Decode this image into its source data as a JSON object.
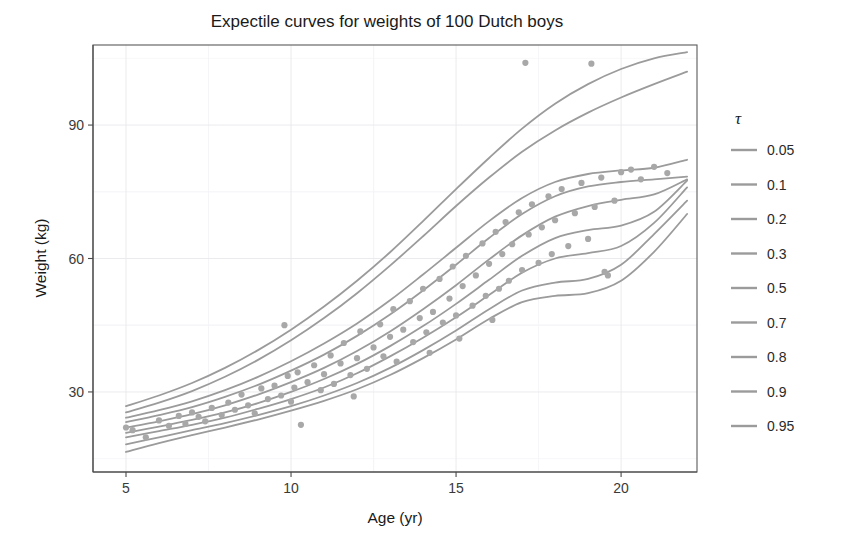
{
  "chart_data": {
    "type": "line",
    "title": "Expectile curves for weights of 100 Dutch boys",
    "xlabel": "Age (yr)",
    "ylabel": "Weight (kg)",
    "xlim": [
      4.0,
      22.3
    ],
    "ylim": [
      12.0,
      108.0
    ],
    "xticks": [
      5,
      10,
      15,
      20
    ],
    "xtick_labels": [
      "5",
      "10",
      "15",
      "20"
    ],
    "yticks": [
      30,
      60,
      90
    ],
    "ytick_labels": [
      "30",
      "60",
      "90"
    ],
    "grid": "minor and major, light gray",
    "legend_position": "right",
    "legend_title": "τ",
    "curve_color": "#9b9b9b",
    "point_color": "#a8a8a8",
    "legend": [
      {
        "label": "0.05",
        "color": "#9b9b9b"
      },
      {
        "label": "0.1",
        "color": "#9b9b9b"
      },
      {
        "label": "0.2",
        "color": "#9b9b9b"
      },
      {
        "label": "0.3",
        "color": "#9b9b9b"
      },
      {
        "label": "0.5",
        "color": "#9b9b9b"
      },
      {
        "label": "0.7",
        "color": "#9b9b9b"
      },
      {
        "label": "0.8",
        "color": "#9b9b9b"
      },
      {
        "label": "0.9",
        "color": "#9b9b9b"
      },
      {
        "label": "0.95",
        "color": "#9b9b9b"
      }
    ],
    "x": [
      5,
      6,
      7,
      8,
      9,
      10,
      11,
      12,
      13,
      14,
      15,
      16,
      17,
      18,
      19,
      20,
      21,
      22
    ],
    "series": [
      {
        "name": "0.05",
        "values": [
          16.5,
          18.5,
          20.3,
          22.0,
          23.8,
          25.8,
          28.0,
          30.6,
          33.8,
          37.6,
          41.8,
          46.4,
          50.2,
          51.6,
          52.2,
          55.0,
          61.5,
          70.0
        ]
      },
      {
        "name": "0.1",
        "values": [
          18.2,
          19.8,
          21.4,
          23.0,
          24.8,
          26.8,
          29.2,
          32.0,
          35.4,
          39.4,
          43.8,
          48.6,
          52.8,
          54.6,
          55.4,
          58.6,
          65.5,
          73.0
        ]
      },
      {
        "name": "0.2",
        "values": [
          19.8,
          21.2,
          22.6,
          24.2,
          26.2,
          28.4,
          31.0,
          34.2,
          38.0,
          42.2,
          46.8,
          51.8,
          56.8,
          60.0,
          61.2,
          62.8,
          68.0,
          76.0
        ]
      },
      {
        "name": "0.3",
        "values": [
          20.8,
          22.2,
          23.7,
          25.4,
          27.5,
          30.0,
          32.9,
          36.3,
          40.3,
          44.8,
          49.8,
          55.2,
          60.6,
          64.6,
          66.4,
          67.4,
          70.5,
          77.5
        ]
      },
      {
        "name": "0.5",
        "values": [
          22.0,
          23.4,
          25.0,
          27.0,
          29.4,
          32.2,
          35.4,
          39.2,
          43.6,
          48.6,
          54.0,
          59.8,
          65.2,
          69.4,
          71.8,
          73.2,
          74.4,
          77.8
        ]
      },
      {
        "name": "0.7",
        "values": [
          23.2,
          24.8,
          26.6,
          28.9,
          31.6,
          34.8,
          38.4,
          42.6,
          47.4,
          52.8,
          58.6,
          64.6,
          70.0,
          74.0,
          76.2,
          77.2,
          77.8,
          78.4
        ]
      },
      {
        "name": "0.8",
        "values": [
          24.2,
          25.9,
          27.9,
          30.4,
          33.4,
          36.9,
          40.9,
          45.4,
          50.6,
          56.4,
          62.4,
          68.4,
          73.6,
          77.2,
          79.0,
          79.8,
          80.4,
          82.2
        ]
      },
      {
        "name": "0.9",
        "values": [
          25.4,
          27.6,
          30.2,
          33.4,
          37.2,
          41.6,
          46.6,
          52.2,
          58.4,
          65.0,
          71.8,
          78.2,
          84.0,
          88.8,
          92.8,
          96.2,
          99.2,
          102.0
        ]
      },
      {
        "name": "0.95",
        "values": [
          26.8,
          29.2,
          32.0,
          35.4,
          39.4,
          44.0,
          49.2,
          55.0,
          61.4,
          68.4,
          75.6,
          82.6,
          89.2,
          94.8,
          99.2,
          102.6,
          105.0,
          106.4
        ]
      }
    ],
    "points": [
      [
        5.0,
        22.0
      ],
      [
        5.2,
        21.4
      ],
      [
        5.6,
        19.8
      ],
      [
        6.0,
        23.6
      ],
      [
        6.3,
        22.4
      ],
      [
        6.6,
        24.6
      ],
      [
        6.8,
        22.8
      ],
      [
        7.0,
        25.4
      ],
      [
        7.2,
        24.4
      ],
      [
        7.4,
        23.4
      ],
      [
        7.6,
        26.4
      ],
      [
        7.9,
        24.8
      ],
      [
        8.1,
        27.6
      ],
      [
        8.3,
        26.0
      ],
      [
        8.5,
        29.4
      ],
      [
        8.7,
        27.0
      ],
      [
        8.9,
        25.2
      ],
      [
        9.1,
        30.8
      ],
      [
        9.3,
        28.4
      ],
      [
        9.5,
        31.4
      ],
      [
        9.7,
        29.2
      ],
      [
        9.8,
        45.0
      ],
      [
        9.9,
        33.6
      ],
      [
        10.0,
        27.8
      ],
      [
        10.1,
        31.0
      ],
      [
        10.2,
        34.4
      ],
      [
        10.3,
        22.6
      ],
      [
        10.5,
        32.2
      ],
      [
        10.7,
        36.0
      ],
      [
        10.9,
        30.4
      ],
      [
        11.0,
        34.0
      ],
      [
        11.2,
        38.2
      ],
      [
        11.3,
        31.8
      ],
      [
        11.5,
        36.4
      ],
      [
        11.6,
        41.0
      ],
      [
        11.8,
        33.8
      ],
      [
        11.9,
        29.0
      ],
      [
        12.0,
        37.6
      ],
      [
        12.1,
        43.6
      ],
      [
        12.3,
        35.2
      ],
      [
        12.5,
        40.0
      ],
      [
        12.7,
        45.2
      ],
      [
        12.8,
        38.0
      ],
      [
        13.0,
        42.4
      ],
      [
        13.1,
        48.6
      ],
      [
        13.2,
        36.8
      ],
      [
        13.4,
        44.0
      ],
      [
        13.6,
        50.4
      ],
      [
        13.7,
        41.2
      ],
      [
        13.9,
        46.6
      ],
      [
        14.0,
        53.2
      ],
      [
        14.1,
        43.4
      ],
      [
        14.2,
        38.8
      ],
      [
        14.3,
        48.0
      ],
      [
        14.5,
        55.4
      ],
      [
        14.6,
        45.6
      ],
      [
        14.8,
        51.0
      ],
      [
        14.9,
        58.2
      ],
      [
        15.0,
        47.2
      ],
      [
        15.1,
        42.0
      ],
      [
        15.2,
        53.8
      ],
      [
        15.3,
        60.6
      ],
      [
        15.5,
        49.4
      ],
      [
        15.6,
        56.2
      ],
      [
        15.8,
        63.4
      ],
      [
        15.9,
        51.6
      ],
      [
        16.0,
        58.8
      ],
      [
        16.1,
        46.2
      ],
      [
        16.2,
        66.0
      ],
      [
        16.3,
        53.2
      ],
      [
        16.4,
        61.0
      ],
      [
        16.5,
        68.2
      ],
      [
        16.6,
        55.0
      ],
      [
        16.7,
        63.2
      ],
      [
        16.9,
        70.4
      ],
      [
        17.0,
        57.4
      ],
      [
        17.1,
        104.0
      ],
      [
        17.2,
        65.4
      ],
      [
        17.3,
        72.2
      ],
      [
        17.5,
        59.0
      ],
      [
        17.6,
        67.0
      ],
      [
        17.8,
        74.0
      ],
      [
        17.9,
        61.0
      ],
      [
        18.0,
        68.6
      ],
      [
        18.2,
        75.6
      ],
      [
        18.4,
        62.8
      ],
      [
        18.6,
        70.2
      ],
      [
        18.8,
        77.0
      ],
      [
        19.0,
        64.4
      ],
      [
        19.1,
        103.8
      ],
      [
        19.2,
        71.6
      ],
      [
        19.4,
        78.2
      ],
      [
        19.5,
        57.0
      ],
      [
        19.6,
        56.2
      ],
      [
        19.8,
        73.0
      ],
      [
        20.0,
        79.4
      ],
      [
        20.3,
        80.0
      ],
      [
        20.6,
        77.8
      ],
      [
        21.0,
        80.6
      ],
      [
        21.4,
        79.2
      ]
    ]
  }
}
